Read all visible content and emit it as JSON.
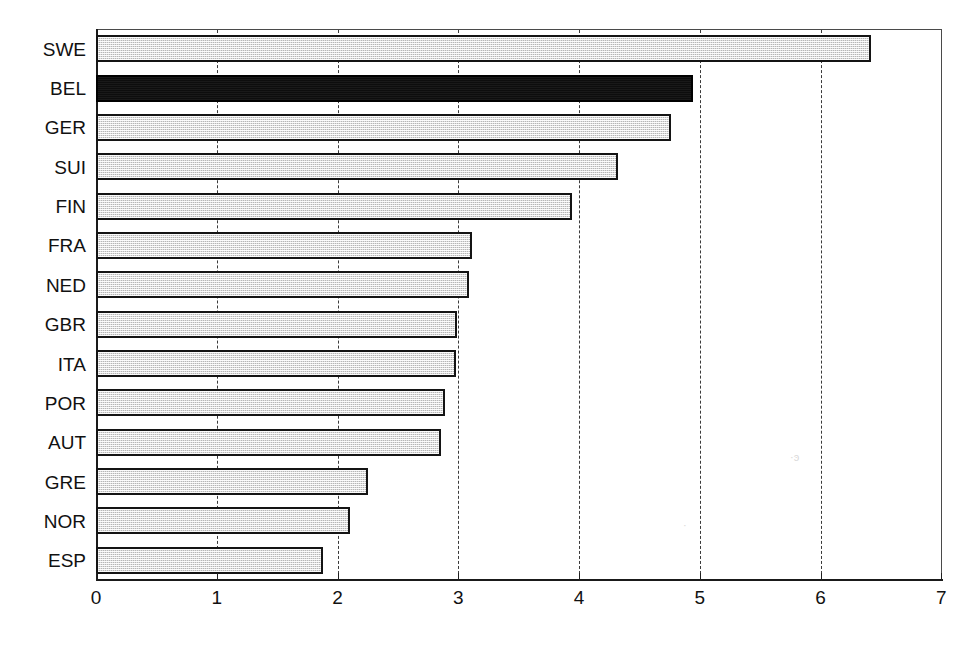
{
  "chart_data": {
    "type": "bar",
    "orientation": "horizontal",
    "title": "",
    "subtitle": "",
    "xlabel": "",
    "ylabel": "",
    "xlim": [
      0,
      7
    ],
    "ylim": null,
    "grid": "vertical-dashed",
    "legend": null,
    "xticks": [
      0,
      1,
      2,
      3,
      4,
      5,
      6,
      7
    ],
    "xtick_labels": [
      "0",
      "1",
      "2",
      "3",
      "4",
      "5",
      "6",
      "7"
    ],
    "categories": [
      "SWE",
      "BEL",
      "GER",
      "SUI",
      "FIN",
      "FRA",
      "NED",
      "GBR",
      "ITA",
      "POR",
      "AUT",
      "GRE",
      "NOR",
      "ESP"
    ],
    "values": [
      6.42,
      4.94,
      4.76,
      4.32,
      3.94,
      3.11,
      3.09,
      2.99,
      2.98,
      2.89,
      2.86,
      2.25,
      2.1,
      1.88
    ],
    "highlighted": [
      "BEL"
    ],
    "colors": {
      "bar_fill": "#b6b6b6",
      "bar_fill_highlight": "#0d0d0d",
      "bar_border": "#141414",
      "gridline": "#3a3a3a",
      "axis": "#1a1a1a",
      "background": "#ffffff",
      "text": "#111111"
    },
    "bars": [
      {
        "label": "SWE",
        "value": 6.42,
        "highlight": false
      },
      {
        "label": "BEL",
        "value": 4.94,
        "highlight": true
      },
      {
        "label": "GER",
        "value": 4.76,
        "highlight": false
      },
      {
        "label": "SUI",
        "value": 4.32,
        "highlight": false
      },
      {
        "label": "FIN",
        "value": 3.94,
        "highlight": false
      },
      {
        "label": "FRA",
        "value": 3.11,
        "highlight": false
      },
      {
        "label": "NED",
        "value": 3.09,
        "highlight": false
      },
      {
        "label": "GBR",
        "value": 2.99,
        "highlight": false
      },
      {
        "label": "ITA",
        "value": 2.98,
        "highlight": false
      },
      {
        "label": "POR",
        "value": 2.89,
        "highlight": false
      },
      {
        "label": "AUT",
        "value": 2.86,
        "highlight": false
      },
      {
        "label": "GRE",
        "value": 2.25,
        "highlight": false
      },
      {
        "label": "NOR",
        "value": 2.1,
        "highlight": false
      },
      {
        "label": "ESP",
        "value": 1.88,
        "highlight": false
      }
    ]
  },
  "geometry": {
    "plot_left": 96,
    "plot_right": 942,
    "plot_top": 29,
    "plot_bottom": 580,
    "px_per_unit": 120.75,
    "bar_slot_height": 39.36,
    "bar_height": 27
  }
}
